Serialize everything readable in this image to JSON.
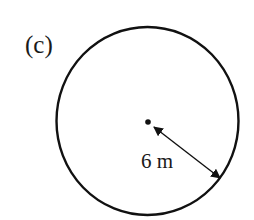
{
  "figure": {
    "label": "(c)",
    "shape": "circle",
    "radius_label": "6 m",
    "colors": {
      "stroke": "#111111",
      "background": "#ffffff",
      "text": "#1a1a1a"
    }
  }
}
